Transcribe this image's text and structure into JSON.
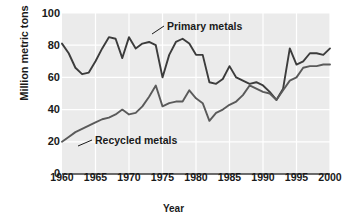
{
  "chart_data": {
    "type": "line",
    "title": "",
    "xlabel": "Year",
    "ylabel": "Million metric tons",
    "xlim": [
      1960,
      2000
    ],
    "ylim": [
      0,
      100
    ],
    "yticks": [
      0,
      20,
      40,
      60,
      80,
      100
    ],
    "xticks": [
      1960,
      1965,
      1970,
      1975,
      1980,
      1985,
      1990,
      1995,
      2000
    ],
    "grid": true,
    "legend_position": "inline-annotations",
    "x": [
      1960,
      1961,
      1962,
      1963,
      1964,
      1965,
      1966,
      1967,
      1968,
      1969,
      1970,
      1971,
      1972,
      1973,
      1974,
      1975,
      1976,
      1977,
      1978,
      1979,
      1980,
      1981,
      1982,
      1983,
      1984,
      1985,
      1986,
      1987,
      1988,
      1989,
      1990,
      1991,
      1992,
      1993,
      1994,
      1995,
      1996,
      1997,
      1998,
      1999,
      2000
    ],
    "series": [
      {
        "name": "Primary metals",
        "color": "#3c3c3c",
        "values": [
          81,
          75,
          66,
          62,
          63,
          70,
          78,
          85,
          84,
          72,
          85,
          78,
          81,
          82,
          80,
          60,
          74,
          82,
          84,
          81,
          74,
          74,
          57,
          56,
          59,
          67,
          60,
          58,
          56,
          57,
          55,
          51,
          46,
          53,
          78,
          68,
          70,
          75,
          75,
          74,
          78
        ]
      },
      {
        "name": "Recycled metals",
        "color": "#5a5a5a",
        "values": [
          20,
          23,
          26,
          28,
          30,
          32,
          34,
          35,
          37,
          40,
          37,
          38,
          42,
          48,
          55,
          42,
          44,
          45,
          45,
          52,
          47,
          44,
          33,
          38,
          40,
          43,
          45,
          49,
          55,
          53,
          51,
          50,
          46,
          52,
          58,
          60,
          66,
          67,
          67,
          68,
          68
        ]
      }
    ],
    "annotations": [
      {
        "text": "Primary metals",
        "x": 1977,
        "y": 92
      },
      {
        "text": "Recycled metals",
        "x": 1968,
        "y": 26
      }
    ]
  },
  "axis": {
    "y_tick_labels": [
      "100",
      "80",
      "60",
      "40",
      "20",
      "0"
    ],
    "x_tick_labels": [
      "1960",
      "1965",
      "1970",
      "1975",
      "1980",
      "1985",
      "1990",
      "1995",
      "2000"
    ],
    "x_axis_title": "Year",
    "y_axis_title": "Million metric tons"
  },
  "labels": {
    "primary": "Primary metals",
    "recycled": "Recycled metals"
  },
  "colors": {
    "plot_background": "#ebebeb",
    "gridline": "#ffffff",
    "primary_line": "#3c3c3c",
    "recycled_line": "#5a5a5a",
    "text": "#1a1a1a"
  }
}
